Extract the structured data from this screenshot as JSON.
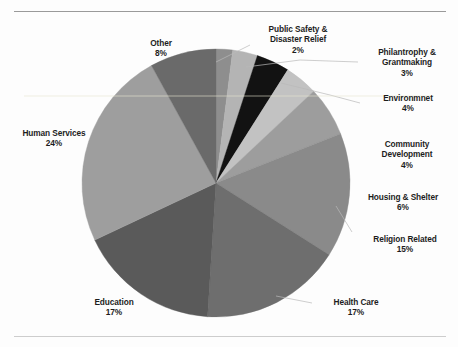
{
  "page": {
    "top_sliver_text": "",
    "background_color": "#fdfdfd",
    "rule_color": "#9a9a9a"
  },
  "chart_data": {
    "type": "pie",
    "title": "",
    "subtitle": "",
    "xlabel": "",
    "ylabel": "",
    "legend_position": "none",
    "grid": false,
    "units": "percent",
    "label_format": "{name}\n{value}%",
    "start_angle_deg": 0,
    "direction": "clockwise",
    "categories": [
      "Public Safety & Disaster Relief",
      "Philantrophy & Grantmaking",
      "Environmnet",
      "Community Development",
      "Housing & Shelter",
      "Religion Related",
      "Health Care",
      "Education",
      "Human Services",
      "Other"
    ],
    "values": [
      2,
      3,
      4,
      4,
      6,
      15,
      17,
      17,
      24,
      8
    ],
    "colors": [
      "#8e8e8e",
      "#b4b4b4",
      "#121212",
      "#c2c2c2",
      "#9d9d9d",
      "#8a8a8a",
      "#6e6e6e",
      "#5a5a5a",
      "#9e9e9e",
      "#6a6a6a"
    ],
    "slices": [
      {
        "name": "Public Safety & Disaster Relief",
        "value": 2,
        "percent_label": "2%",
        "color": "#8e8e8e",
        "leader": true
      },
      {
        "name": "Philantrophy & Grantmaking",
        "value": 3,
        "percent_label": "3%",
        "color": "#b4b4b4",
        "leader": true
      },
      {
        "name": "Environmnet",
        "value": 4,
        "percent_label": "4%",
        "color": "#121212",
        "leader": true
      },
      {
        "name": "Community Development",
        "value": 4,
        "percent_label": "4%",
        "color": "#c2c2c2",
        "leader": false
      },
      {
        "name": "Housing & Shelter",
        "value": 6,
        "percent_label": "6%",
        "color": "#9d9d9d",
        "leader": false
      },
      {
        "name": "Religion Related",
        "value": 15,
        "percent_label": "15%",
        "color": "#8a8a8a",
        "leader": true
      },
      {
        "name": "Health Care",
        "value": 17,
        "percent_label": "17%",
        "color": "#6e6e6e",
        "leader": true
      },
      {
        "name": "Education",
        "value": 17,
        "percent_label": "17%",
        "color": "#5a5a5a",
        "leader": false
      },
      {
        "name": "Human Services",
        "value": 24,
        "percent_label": "24%",
        "color": "#9e9e9e",
        "leader": false
      },
      {
        "name": "Other",
        "value": 8,
        "percent_label": "8%",
        "color": "#6a6a6a",
        "leader": false
      }
    ],
    "total": 100
  },
  "labels": {
    "other": {
      "name": "Other",
      "percent": "8%"
    },
    "public": {
      "name_line1": "Public Safety &",
      "name_line2": "Disaster Relief",
      "percent": "2%"
    },
    "philanthropy": {
      "name_line1": "Philantrophy &",
      "name_line2": "Grantmaking",
      "percent": "3%"
    },
    "environment": {
      "name": "Environmnet",
      "percent": "4%"
    },
    "community": {
      "name_line1": "Community",
      "name_line2": "Development",
      "percent": "4%"
    },
    "housing": {
      "name": "Housing & Shelter",
      "percent": "6%"
    },
    "religion": {
      "name": "Religion Related",
      "percent": "15%"
    },
    "health": {
      "name": "Health Care",
      "percent": "17%"
    },
    "education": {
      "name": "Education",
      "percent": "17%"
    },
    "human": {
      "name": "Human Services",
      "percent": "24%"
    }
  }
}
